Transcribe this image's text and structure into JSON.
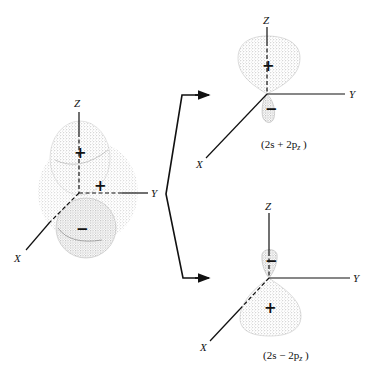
{
  "figure": {
    "left_orbital": {
      "axes": {
        "z": "Z",
        "y": "Y",
        "x": "X"
      },
      "signs": {
        "upper": "+",
        "middle": "+",
        "lower": "−"
      }
    },
    "top_right_orbital": {
      "axes": {
        "z": "Z",
        "y": "Y",
        "x": "X"
      },
      "signs": {
        "large_lobe": "+",
        "small_lobe": "−"
      },
      "caption": "(2s + 2p",
      "caption_sub": "z",
      "caption_end": " )"
    },
    "bottom_right_orbital": {
      "axes": {
        "z": "Z",
        "y": "Y",
        "x": "X"
      },
      "signs": {
        "small_lobe": "−",
        "large_lobe": "+"
      },
      "caption": "(2s − 2p",
      "caption_sub": "z",
      "caption_end": " )"
    },
    "colors": {
      "line": "#111111",
      "stipple": "#8a8a8a",
      "background": "#ffffff"
    }
  }
}
